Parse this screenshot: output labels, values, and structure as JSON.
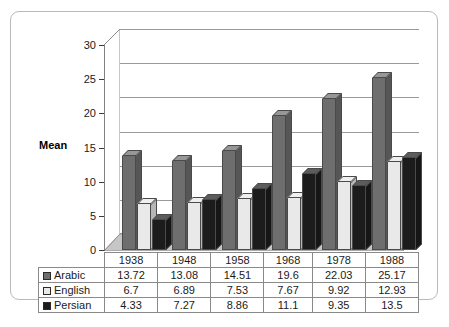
{
  "chart_data": {
    "type": "bar",
    "title": "",
    "subtitle": "",
    "xlabel": "",
    "ylabel": "Mean",
    "categories": [
      "1938",
      "1948",
      "1958",
      "1968",
      "1978",
      "1988"
    ],
    "series": [
      {
        "name": "Arabic",
        "values": [
          13.72,
          13.08,
          14.51,
          19.6,
          22.03,
          25.17
        ],
        "color": "#6e6e6e",
        "swatch": "dark-gray"
      },
      {
        "name": "English",
        "values": [
          6.7,
          6.89,
          7.53,
          7.67,
          9.92,
          12.93
        ],
        "color": "#e9e9e9",
        "swatch": "white"
      },
      {
        "name": "Persian",
        "values": [
          4.33,
          7.27,
          8.86,
          11.1,
          9.35,
          13.5
        ],
        "color": "#1c1c1c",
        "swatch": "black"
      }
    ],
    "ylim": [
      0,
      30
    ],
    "yticks": [
      "0",
      "5",
      "10",
      "15",
      "20",
      "25",
      "30"
    ],
    "grid": true,
    "legend_position": "data-table-row-labels",
    "style": "3d-clustered-column-with-data-table"
  },
  "table": {
    "year_header": [
      "1938",
      "1948",
      "1958",
      "1968",
      "1978",
      "1988"
    ],
    "rows": [
      {
        "label": "Arabic",
        "values": [
          "13.72",
          "13.08",
          "14.51",
          "19.6",
          "22.03",
          "25.17"
        ]
      },
      {
        "label": "English",
        "values": [
          "6.7",
          "6.89",
          "7.53",
          "7.67",
          "9.92",
          "12.93"
        ]
      },
      {
        "label": "Persian",
        "values": [
          "4.33",
          "7.27",
          "8.86",
          "11.1",
          "9.35",
          "13.5"
        ]
      }
    ]
  },
  "axis": {
    "y_label": "Mean",
    "y_ticks": [
      "30",
      "25",
      "20",
      "15",
      "10",
      "5",
      "0"
    ]
  },
  "caption": {
    "text": ""
  },
  "colors": {
    "arabic": "#6e6e6e",
    "english": "#e9e9e9",
    "persian": "#1c1c1c",
    "frame_border": "#b9b9b9",
    "grid": "#9a9a9a",
    "floor": "#c6c6c6"
  }
}
